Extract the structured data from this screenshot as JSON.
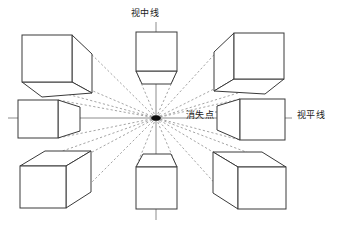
{
  "diagram": {
    "type": "one-point-perspective",
    "background_color": "#ffffff",
    "edge_color": "#3a3a3a",
    "guide_color": "#9a9a9a",
    "axis_color": "#8c8c8c",
    "vanishing_point_color": "#111111"
  },
  "labels": {
    "center_line": "视中线",
    "vanishing_point": "消失点",
    "horizon_line": "视平线"
  },
  "geometry": {
    "vanishing_point": {
      "x": 156,
      "y": 118
    },
    "horizon_line": {
      "x1": 8,
      "y1": 118,
      "x2": 292,
      "y2": 118
    },
    "center_line": {
      "x1": 156,
      "y1": 22,
      "x2": 156,
      "y2": 220
    },
    "label_leader_vanishing_point": {
      "x1": 215,
      "y1": 112,
      "x2": 228,
      "y2": 112
    }
  },
  "cubes": [
    {
      "name": "cube-top-left",
      "position": "top-left",
      "visible_faces": [
        "front",
        "right",
        "bottom"
      ],
      "front_face": {
        "x": 22,
        "y": 35,
        "w": 50,
        "h": 47
      }
    },
    {
      "name": "cube-top-center",
      "position": "top-center",
      "visible_faces": [
        "front",
        "bottom"
      ],
      "front_face": {
        "x": 136,
        "y": 32,
        "w": 41,
        "h": 39
      }
    },
    {
      "name": "cube-top-right",
      "position": "top-right",
      "visible_faces": [
        "front",
        "left",
        "bottom"
      ],
      "front_face": {
        "x": 234,
        "y": 33,
        "w": 50,
        "h": 46
      }
    },
    {
      "name": "cube-middle-left",
      "position": "middle-left",
      "visible_faces": [
        "front",
        "right"
      ],
      "front_face": {
        "x": 18,
        "y": 100,
        "w": 40,
        "h": 38
      }
    },
    {
      "name": "cube-middle-right",
      "position": "middle-right",
      "visible_faces": [
        "front",
        "left"
      ],
      "front_face": {
        "x": 240,
        "y": 99,
        "w": 45,
        "h": 41
      }
    },
    {
      "name": "cube-bottom-left",
      "position": "bottom-left",
      "visible_faces": [
        "front",
        "right",
        "top"
      ],
      "front_face": {
        "x": 20,
        "y": 166,
        "w": 46,
        "h": 42
      }
    },
    {
      "name": "cube-bottom-center",
      "position": "bottom-center",
      "visible_faces": [
        "front",
        "top"
      ],
      "front_face": {
        "x": 136,
        "y": 167,
        "w": 41,
        "h": 42
      }
    },
    {
      "name": "cube-bottom-right",
      "position": "bottom-right",
      "visible_faces": [
        "front",
        "left",
        "top"
      ],
      "front_face": {
        "x": 238,
        "y": 167,
        "w": 48,
        "h": 42
      }
    }
  ]
}
